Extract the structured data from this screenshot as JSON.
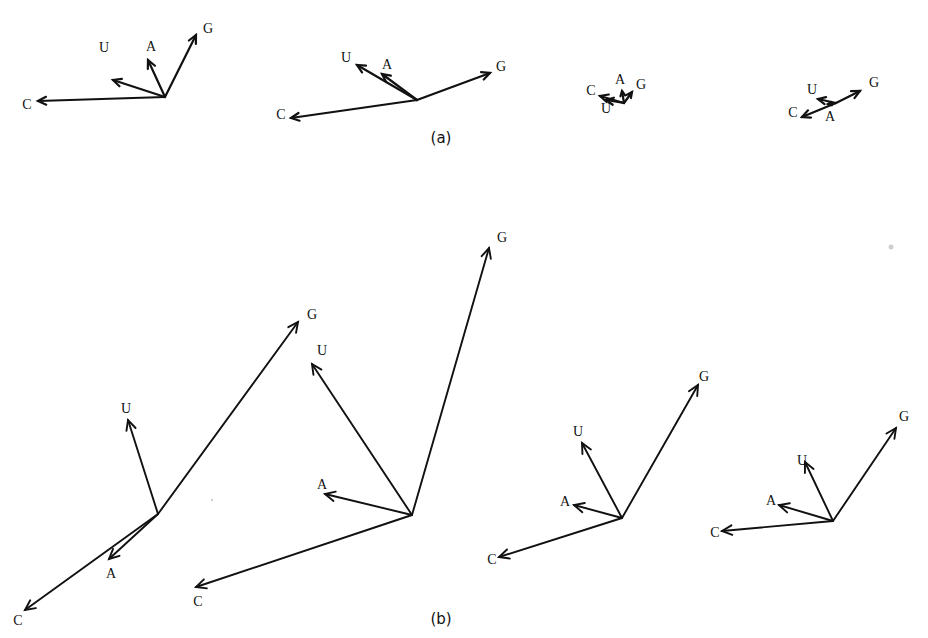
{
  "figure": {
    "panels": [
      {
        "id": "a",
        "label": "(a)",
        "label_pos": [
          441,
          143
        ],
        "stroke_class": "vec",
        "arrow_head": 9,
        "diagrams": [
          {
            "origin": [
              165,
              97
            ],
            "vectors": [
              {
                "base": "C",
                "tip": [
                  38,
                  101
                ],
                "label_pos": [
                  27,
                  106
                ]
              },
              {
                "base": "U",
                "tip": [
                  113,
                  80
                ],
                "label_pos": [
                  104,
                  49
                ]
              },
              {
                "base": "A",
                "tip": [
                  148,
                  60
                ],
                "label_pos": [
                  151,
                  48
                ]
              },
              {
                "base": "G",
                "tip": [
                  196,
                  35
                ],
                "label_pos": [
                  208,
                  30
                ]
              }
            ]
          },
          {
            "origin": [
              417,
              100
            ],
            "vectors": [
              {
                "base": "C",
                "tip": [
                  291,
                  118
                ],
                "label_pos": [
                  281,
                  116
                ]
              },
              {
                "base": "U",
                "tip": [
                  357,
                  65
                ],
                "label_pos": [
                  346,
                  59
                ]
              },
              {
                "base": "A",
                "tip": [
                  382,
                  74
                ],
                "label_pos": [
                  387,
                  66
                ]
              },
              {
                "base": "G",
                "tip": [
                  490,
                  73
                ],
                "label_pos": [
                  501,
                  68
                ]
              }
            ]
          },
          {
            "origin": [
              624,
              103
            ],
            "vectors": [
              {
                "base": "C",
                "tip": [
                  600,
                  96
                ],
                "label_pos": [
                  591,
                  92
                ]
              },
              {
                "base": "U",
                "tip": [
                  606,
                  100
                ],
                "label_pos": [
                  606,
                  110
                ]
              },
              {
                "base": "A",
                "tip": [
                  622,
                  91
                ],
                "label_pos": [
                  620,
                  81
                ]
              },
              {
                "base": "G",
                "tip": [
                  632,
                  92
                ],
                "label_pos": [
                  641,
                  86
                ]
              }
            ]
          },
          {
            "origin": [
              836,
              103
            ],
            "vectors": [
              {
                "base": "C",
                "tip": [
                  802,
                  117
                ],
                "label_pos": [
                  793,
                  114
                ]
              },
              {
                "base": "U",
                "tip": [
                  818,
                  99
                ],
                "label_pos": [
                  812,
                  91
                ]
              },
              {
                "base": "A",
                "tip": [
                  828,
                  104
                ],
                "label_pos": [
                  830,
                  118
                ]
              },
              {
                "base": "G",
                "tip": [
                  860,
                  91
                ],
                "label_pos": [
                  874,
                  84
                ]
              }
            ]
          }
        ]
      },
      {
        "id": "b",
        "label": "(b)",
        "label_pos": [
          441,
          624
        ],
        "stroke_class": "vec-thin",
        "arrow_head": 11,
        "diagrams": [
          {
            "origin": [
              158,
              514
            ],
            "vectors": [
              {
                "base": "C",
                "tip": [
                  25,
                  610
                ],
                "label_pos": [
                  18,
                  622
                ]
              },
              {
                "base": "U",
                "tip": [
                  128,
                  420
                ],
                "label_pos": [
                  126,
                  410
                ]
              },
              {
                "base": "A",
                "tip": [
                  109,
                  559
                ],
                "label_pos": [
                  111,
                  575
                ]
              },
              {
                "base": "G",
                "tip": [
                  298,
                  322
                ],
                "label_pos": [
                  312,
                  316
                ]
              }
            ]
          },
          {
            "origin": [
              412,
              515
            ],
            "vectors": [
              {
                "base": "C",
                "tip": [
                  196,
                  587
                ],
                "label_pos": [
                  198,
                  603
                ]
              },
              {
                "base": "U",
                "tip": [
                  312,
                  364
                ],
                "label_pos": [
                  322,
                  352
                ]
              },
              {
                "base": "A",
                "tip": [
                  325,
                  494
                ],
                "label_pos": [
                  322,
                  486
                ]
              },
              {
                "base": "G",
                "tip": [
                  489,
                  248
                ],
                "label_pos": [
                  502,
                  239
                ]
              }
            ]
          },
          {
            "origin": [
              622,
              518
            ],
            "vectors": [
              {
                "base": "C",
                "tip": [
                  499,
                  557
                ],
                "label_pos": [
                  492,
                  561
                ]
              },
              {
                "base": "U",
                "tip": [
                  582,
                  443
                ],
                "label_pos": [
                  578,
                  433
                ]
              },
              {
                "base": "A",
                "tip": [
                  574,
                  505
                ],
                "label_pos": [
                  565,
                  503
                ]
              },
              {
                "base": "G",
                "tip": [
                  698,
                  385
                ],
                "label_pos": [
                  704,
                  378
                ]
              }
            ]
          },
          {
            "origin": [
              833,
              521
            ],
            "vectors": [
              {
                "base": "C",
                "tip": [
                  722,
                  531
                ],
                "label_pos": [
                  715,
                  534
                ]
              },
              {
                "base": "U",
                "tip": [
                  805,
                  462
                ],
                "label_pos": [
                  802,
                  462
                ]
              },
              {
                "base": "A",
                "tip": [
                  779,
                  505
                ],
                "label_pos": [
                  771,
                  502
                ]
              },
              {
                "base": "G",
                "tip": [
                  896,
                  428
                ],
                "label_pos": [
                  904,
                  418
                ]
              }
            ]
          }
        ]
      }
    ],
    "bases": [
      "A",
      "C",
      "G",
      "U"
    ],
    "colors": {
      "ink": "#111111",
      "paper": "#ffffff"
    }
  }
}
